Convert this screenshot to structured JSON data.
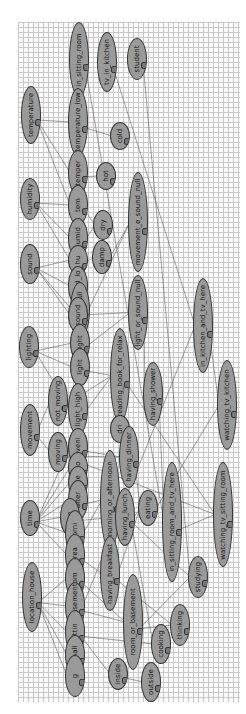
{
  "diagram": {
    "type": "bayesian-network",
    "orientation": "rotated-90",
    "background": "grid",
    "nodes": [
      {
        "id": "in_sitting_room",
        "label": "in_sitting_room",
        "x": 69,
        "y": 22,
        "w": 20,
        "h": 75
      },
      {
        "id": "tv_in_kitchen",
        "label": "tv_in_kitchen",
        "x": 97,
        "y": 32,
        "w": 20,
        "h": 60
      },
      {
        "id": "student",
        "label": "student",
        "x": 127,
        "y": 38,
        "w": 20,
        "h": 42
      },
      {
        "id": "temperature",
        "label": "temperature",
        "x": 21,
        "y": 86,
        "w": 20,
        "h": 58
      },
      {
        "id": "temperature_low",
        "label": "temperature_low",
        "x": 68,
        "y": 88,
        "w": 20,
        "h": 68
      },
      {
        "id": "cold",
        "label": "cold",
        "x": 110,
        "y": 122,
        "w": 20,
        "h": 28
      },
      {
        "id": "temperature_med",
        "label": "temper",
        "x": 68,
        "y": 150,
        "w": 20,
        "h": 45
      },
      {
        "id": "hot",
        "label": "hot",
        "x": 96,
        "y": 162,
        "w": 20,
        "h": 28
      },
      {
        "id": "humidity",
        "label": "humidity",
        "x": 20,
        "y": 178,
        "w": 20,
        "h": 42
      },
      {
        "id": "temperature_high",
        "label": "tem",
        "x": 68,
        "y": 185,
        "w": 20,
        "h": 40
      },
      {
        "id": "humidity_high",
        "label": "humid",
        "x": 68,
        "y": 218,
        "w": 20,
        "h": 40
      },
      {
        "id": "dry",
        "label": "dry",
        "x": 93,
        "y": 210,
        "w": 20,
        "h": 30
      },
      {
        "id": "movement_e_sound_null",
        "label": "movement_e_sound_null",
        "x": 128,
        "y": 172,
        "w": 20,
        "h": 100
      },
      {
        "id": "humidity_low",
        "label": "hu",
        "x": 68,
        "y": 245,
        "w": 20,
        "h": 30
      },
      {
        "id": "damp",
        "label": "damp",
        "x": 92,
        "y": 240,
        "w": 20,
        "h": 34
      },
      {
        "id": "sound",
        "label": "sound",
        "x": 20,
        "y": 244,
        "w": 20,
        "h": 40
      },
      {
        "id": "sound_low",
        "label": "sound_lo",
        "x": 68,
        "y": 266,
        "w": 20,
        "h": 40
      },
      {
        "id": "sound_null",
        "label": "sound_null",
        "x": 70,
        "y": 282,
        "w": 20,
        "h": 56
      },
      {
        "id": "light_or_sound_null",
        "label": "light_or_sound_null",
        "x": 128,
        "y": 275,
        "w": 20,
        "h": 75
      },
      {
        "id": "in_kitchen_and_tv_here",
        "label": "in_kitchen_and_tv_here",
        "x": 193,
        "y": 278,
        "w": 20,
        "h": 95
      },
      {
        "id": "sound_high",
        "label": "sound",
        "x": 68,
        "y": 297,
        "w": 20,
        "h": 36
      },
      {
        "id": "lighting",
        "label": "lighting",
        "x": 19,
        "y": 326,
        "w": 20,
        "h": 42
      },
      {
        "id": "light_low",
        "label": "light",
        "x": 70,
        "y": 324,
        "w": 20,
        "h": 38
      },
      {
        "id": "light_med",
        "label": "light",
        "x": 70,
        "y": 348,
        "w": 20,
        "h": 38
      },
      {
        "id": "reading_book_for_relax",
        "label": "reading_book_for_relax",
        "x": 110,
        "y": 328,
        "w": 20,
        "h": 95
      },
      {
        "id": "having_shower",
        "label": "having_shower",
        "x": 143,
        "y": 362,
        "w": 20,
        "h": 64
      },
      {
        "id": "watching_tv_kitchen",
        "label": "watching_tv_kitchen",
        "x": 217,
        "y": 360,
        "w": 20,
        "h": 90
      },
      {
        "id": "not_moving",
        "label": "not_moving",
        "x": 48,
        "y": 376,
        "w": 20,
        "h": 50
      },
      {
        "id": "light_high",
        "label": "light_high",
        "x": 68,
        "y": 383,
        "w": 20,
        "h": 52
      },
      {
        "id": "movement",
        "label": "movement",
        "x": 20,
        "y": 404,
        "w": 20,
        "h": 52
      },
      {
        "id": "moving",
        "label": "moving",
        "x": 48,
        "y": 432,
        "w": 20,
        "h": 40
      },
      {
        "id": "evening",
        "label": "eveni",
        "x": 68,
        "y": 428,
        "w": 20,
        "h": 38
      },
      {
        "id": "drinking",
        "label": "dri",
        "x": 110,
        "y": 415,
        "w": 20,
        "h": 28
      },
      {
        "id": "having_dinner",
        "label": "having_dinner",
        "x": 119,
        "y": 426,
        "w": 20,
        "h": 62
      },
      {
        "id": "morning",
        "label": "mo",
        "x": 68,
        "y": 452,
        "w": 20,
        "h": 30
      },
      {
        "id": "night",
        "label": "afte",
        "x": 68,
        "y": 466,
        "w": 20,
        "h": 32
      },
      {
        "id": "afternoon",
        "label": "after",
        "x": 68,
        "y": 480,
        "w": 20,
        "h": 40
      },
      {
        "id": "morning_or_afternoon",
        "label": "morning_or_afternoon",
        "x": 100,
        "y": 450,
        "w": 20,
        "h": 100
      },
      {
        "id": "having_lunch",
        "label": "having_lunch",
        "x": 115,
        "y": 488,
        "w": 20,
        "h": 58
      },
      {
        "id": "eating",
        "label": "eating",
        "x": 138,
        "y": 490,
        "w": 20,
        "h": 36
      },
      {
        "id": "in_sitting_room_and_tv_here",
        "label": "in_sitting_room_and_tv_here",
        "x": 162,
        "y": 462,
        "w": 20,
        "h": 120
      },
      {
        "id": "watching_tv_sitting_room",
        "label": "watching_tv_sitting_room",
        "x": 213,
        "y": 462,
        "w": 20,
        "h": 105
      },
      {
        "id": "time",
        "label": "time",
        "x": 20,
        "y": 500,
        "w": 20,
        "h": 36
      },
      {
        "id": "lunch",
        "label": "lun",
        "x": 60,
        "y": 498,
        "w": 20,
        "h": 38
      },
      {
        "id": "morning_time",
        "label": "morni",
        "x": 65,
        "y": 510,
        "w": 20,
        "h": 46
      },
      {
        "id": "breakfast",
        "label": "brea",
        "x": 65,
        "y": 534,
        "w": 20,
        "h": 42
      },
      {
        "id": "having_breakfast",
        "label": "having_breakfast",
        "x": 100,
        "y": 536,
        "w": 20,
        "h": 75
      },
      {
        "id": "studying",
        "label": "studying",
        "x": 188,
        "y": 556,
        "w": 20,
        "h": 42
      },
      {
        "id": "location_house",
        "label": "location_house",
        "x": 22,
        "y": 562,
        "w": 20,
        "h": 70
      },
      {
        "id": "room",
        "label": "om",
        "x": 65,
        "y": 558,
        "w": 20,
        "h": 40
      },
      {
        "id": "in_basement",
        "label": "in_basement",
        "x": 65,
        "y": 582,
        "w": 20,
        "h": 48
      },
      {
        "id": "room_or_basement",
        "label": "room_or_basement",
        "x": 123,
        "y": 574,
        "w": 20,
        "h": 96
      },
      {
        "id": "thinking",
        "label": "thinking",
        "x": 170,
        "y": 604,
        "w": 20,
        "h": 42
      },
      {
        "id": "sitting_room",
        "label": "sittin",
        "x": 65,
        "y": 610,
        "w": 20,
        "h": 44
      },
      {
        "id": "cooking",
        "label": "cooking",
        "x": 151,
        "y": 624,
        "w": 20,
        "h": 40
      },
      {
        "id": "small",
        "label": "small",
        "x": 65,
        "y": 635,
        "w": 20,
        "h": 40
      },
      {
        "id": "inside",
        "label": "inside",
        "x": 108,
        "y": 658,
        "w": 20,
        "h": 32
      },
      {
        "id": "garage",
        "label": "g",
        "x": 65,
        "y": 655,
        "w": 20,
        "h": 42
      },
      {
        "id": "outside",
        "label": "outside",
        "x": 141,
        "y": 662,
        "w": 20,
        "h": 40
      }
    ],
    "colors": {
      "node_fill": "#9a9a9a",
      "node_border": "#333333",
      "edge": "#333333",
      "grid": "#c9c9c9",
      "canvas": "#fbfbfb"
    }
  }
}
